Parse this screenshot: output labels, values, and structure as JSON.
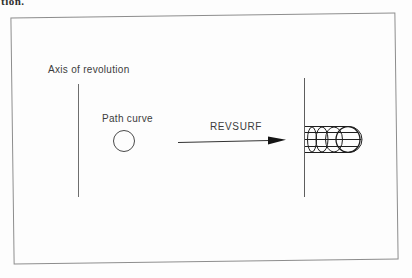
{
  "page": {
    "top_text_fragment": "tion."
  },
  "figure": {
    "axis_label": "Axis of revolution",
    "path_curve_label": "Path curve",
    "command_label": "REVSURF",
    "colors": {
      "frame_border": "#8d8d8d",
      "axis_line": "#6e6e6e",
      "label_text": "#3c3c3c",
      "arrow": "#1c1c1c",
      "wireframe": "#1e1e1e",
      "background": "#fdfdfd"
    }
  }
}
